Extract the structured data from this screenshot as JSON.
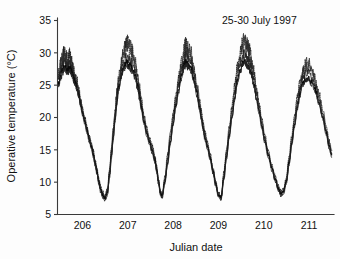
{
  "chart_data": {
    "type": "line",
    "title": "",
    "annotation": "25-30 July 1997",
    "xlabel": "Julian date",
    "ylabel": "Operative temperature (°C)",
    "xlim": [
      205.45,
      211.55
    ],
    "ylim": [
      5,
      35
    ],
    "xticks": [
      206,
      207,
      208,
      209,
      210,
      211
    ],
    "xtick_labels": [
      "206",
      "207",
      "208",
      "209",
      "210",
      "211"
    ],
    "yticks": [
      5,
      10,
      15,
      20,
      25,
      30,
      35
    ],
    "ytick_labels": [
      "5",
      "10",
      "15",
      "20",
      "25",
      "30",
      "35"
    ],
    "grid": false,
    "legend": false,
    "series": [
      {
        "name": "upper-envelope-dotted",
        "style": "dotted",
        "x": [
          205.47,
          205.52,
          205.56,
          205.6,
          205.64,
          205.68,
          205.72,
          205.76,
          205.8,
          205.84,
          205.88,
          205.92,
          205.96,
          206.0,
          206.05,
          206.1,
          206.15,
          206.2,
          206.24,
          206.28,
          206.32,
          206.36,
          206.4,
          206.45,
          206.5,
          206.55,
          206.6,
          206.64,
          206.68,
          206.72,
          206.76,
          206.8,
          206.86,
          206.92,
          206.98,
          207.04,
          207.1,
          207.16,
          207.22,
          207.26,
          207.3,
          207.36,
          207.42,
          207.48,
          207.54,
          207.6,
          207.64,
          207.68,
          207.72,
          207.76,
          207.82,
          207.88,
          207.94,
          208.0,
          208.06,
          208.12,
          208.18,
          208.24,
          208.28,
          208.33,
          208.4,
          208.46,
          208.52,
          208.58,
          208.62,
          208.66,
          208.7,
          208.76,
          208.82,
          208.88,
          208.94,
          209.0,
          209.06,
          209.12,
          209.18,
          209.24,
          209.3,
          209.36,
          209.42,
          209.48,
          209.54,
          209.6,
          209.64,
          209.68,
          209.72,
          209.78,
          209.84,
          209.9,
          209.96,
          210.02,
          210.1,
          210.18,
          210.26,
          210.32,
          210.38,
          210.44,
          210.5,
          210.56,
          210.62,
          210.68,
          210.74,
          210.8,
          210.86,
          210.92,
          210.98,
          211.06,
          211.14,
          211.22,
          211.3,
          211.38,
          211.44,
          211.5
        ],
        "y": [
          26.6,
          28.3,
          29.2,
          30.1,
          29.4,
          28.9,
          29.6,
          28.6,
          27.3,
          26.3,
          25.6,
          24.2,
          22.8,
          21.4,
          20.1,
          18.6,
          17.2,
          16.0,
          14.8,
          13.4,
          12.1,
          10.6,
          9.3,
          8.4,
          7.9,
          9.0,
          12.2,
          15.4,
          18.3,
          21.2,
          24.0,
          26.4,
          28.8,
          30.4,
          31.6,
          31.0,
          30.5,
          28.7,
          26.4,
          24.6,
          22.8,
          20.3,
          18.4,
          16.9,
          15.6,
          14.0,
          12.3,
          10.3,
          8.6,
          8.2,
          10.9,
          14.3,
          17.6,
          20.6,
          23.4,
          26.0,
          28.3,
          30.2,
          31.4,
          30.6,
          29.8,
          27.6,
          25.3,
          22.9,
          21.1,
          19.3,
          17.8,
          16.1,
          14.3,
          12.2,
          10.1,
          8.3,
          7.9,
          11.5,
          15.2,
          18.6,
          21.8,
          25.0,
          27.8,
          30.0,
          31.6,
          32.0,
          31.1,
          30.4,
          29.3,
          27.1,
          24.5,
          22.0,
          19.6,
          17.4,
          14.9,
          12.6,
          10.8,
          9.4,
          8.6,
          9.1,
          10.8,
          14.0,
          17.2,
          20.3,
          23.0,
          25.4,
          27.2,
          28.1,
          28.5,
          27.4,
          25.8,
          23.6,
          21.2,
          18.6,
          16.4,
          14.9
        ]
      },
      {
        "name": "mid-trace",
        "style": "solid-thin",
        "x": [
          205.47,
          205.52,
          205.56,
          205.6,
          205.64,
          205.68,
          205.72,
          205.76,
          205.8,
          205.84,
          205.88,
          205.92,
          205.96,
          206.0,
          206.05,
          206.1,
          206.15,
          206.2,
          206.24,
          206.28,
          206.32,
          206.36,
          206.4,
          206.45,
          206.5,
          206.55,
          206.6,
          206.64,
          206.68,
          206.72,
          206.76,
          206.8,
          206.86,
          206.92,
          206.98,
          207.04,
          207.1,
          207.16,
          207.22,
          207.26,
          207.3,
          207.36,
          207.42,
          207.48,
          207.54,
          207.6,
          207.64,
          207.68,
          207.72,
          207.76,
          207.82,
          207.88,
          207.94,
          208.0,
          208.06,
          208.12,
          208.18,
          208.24,
          208.28,
          208.33,
          208.4,
          208.46,
          208.52,
          208.58,
          208.62,
          208.66,
          208.7,
          208.76,
          208.82,
          208.88,
          208.94,
          209.0,
          209.06,
          209.12,
          209.18,
          209.24,
          209.3,
          209.36,
          209.42,
          209.48,
          209.54,
          209.6,
          209.64,
          209.68,
          209.72,
          209.78,
          209.84,
          209.9,
          209.96,
          210.02,
          210.1,
          210.18,
          210.26,
          210.32,
          210.38,
          210.44,
          210.5,
          210.56,
          210.62,
          210.68,
          210.74,
          210.8,
          210.86,
          210.92,
          210.98,
          211.06,
          211.14,
          211.22,
          211.3,
          211.38,
          211.44,
          211.5
        ],
        "y": [
          25.8,
          27.2,
          28.0,
          28.6,
          28.2,
          27.9,
          28.3,
          27.6,
          26.6,
          25.8,
          25.0,
          23.8,
          22.4,
          21.0,
          19.7,
          18.3,
          16.9,
          15.7,
          14.5,
          13.1,
          11.8,
          10.3,
          9.0,
          8.1,
          7.6,
          8.6,
          11.6,
          14.7,
          17.6,
          20.4,
          23.1,
          25.5,
          27.6,
          28.9,
          29.4,
          29.0,
          28.4,
          27.1,
          25.3,
          23.7,
          22.0,
          19.7,
          17.9,
          16.4,
          15.1,
          13.6,
          12.0,
          10.1,
          8.4,
          8.0,
          10.4,
          13.6,
          16.8,
          19.8,
          22.5,
          25.0,
          27.2,
          28.9,
          29.6,
          29.1,
          28.4,
          26.5,
          24.4,
          22.2,
          20.5,
          18.8,
          17.3,
          15.7,
          13.9,
          11.9,
          9.9,
          8.1,
          7.7,
          11.0,
          14.5,
          17.8,
          20.9,
          23.9,
          26.6,
          28.5,
          29.7,
          29.9,
          29.3,
          28.7,
          27.8,
          25.9,
          23.6,
          21.3,
          19.0,
          16.9,
          14.5,
          12.3,
          10.5,
          9.1,
          8.3,
          8.8,
          10.4,
          13.4,
          16.5,
          19.5,
          22.1,
          24.4,
          26.1,
          26.8,
          27.0,
          26.2,
          24.8,
          22.8,
          20.5,
          18.0,
          15.9,
          14.4
        ]
      },
      {
        "name": "lower-trace",
        "style": "solid",
        "x": [
          205.47,
          205.52,
          205.56,
          205.6,
          205.64,
          205.68,
          205.72,
          205.76,
          205.8,
          205.84,
          205.88,
          205.92,
          205.96,
          206.0,
          206.05,
          206.1,
          206.15,
          206.2,
          206.24,
          206.28,
          206.32,
          206.36,
          206.4,
          206.45,
          206.5,
          206.55,
          206.6,
          206.64,
          206.68,
          206.72,
          206.76,
          206.8,
          206.86,
          206.92,
          206.98,
          207.04,
          207.1,
          207.16,
          207.22,
          207.26,
          207.3,
          207.36,
          207.42,
          207.48,
          207.54,
          207.6,
          207.64,
          207.68,
          207.72,
          207.76,
          207.82,
          207.88,
          207.94,
          208.0,
          208.06,
          208.12,
          208.18,
          208.24,
          208.28,
          208.33,
          208.4,
          208.46,
          208.52,
          208.58,
          208.62,
          208.66,
          208.7,
          208.76,
          208.82,
          208.88,
          208.94,
          209.0,
          209.06,
          209.12,
          209.18,
          209.24,
          209.3,
          209.36,
          209.42,
          209.48,
          209.54,
          209.6,
          209.64,
          209.68,
          209.72,
          209.78,
          209.84,
          209.9,
          209.96,
          210.02,
          210.1,
          210.18,
          210.26,
          210.32,
          210.38,
          210.44,
          210.5,
          210.56,
          210.62,
          210.68,
          210.74,
          210.8,
          210.86,
          210.92,
          210.98,
          211.06,
          211.14,
          211.22,
          211.3,
          211.38,
          211.44,
          211.5
        ],
        "y": [
          25.2,
          26.4,
          27.2,
          27.8,
          27.5,
          27.2,
          27.6,
          27.0,
          26.1,
          25.4,
          24.6,
          23.4,
          22.0,
          20.7,
          19.4,
          18.0,
          16.6,
          15.4,
          14.2,
          12.9,
          11.6,
          10.1,
          8.8,
          7.9,
          7.5,
          8.3,
          11.1,
          14.1,
          16.9,
          19.7,
          22.4,
          24.7,
          26.7,
          27.9,
          28.3,
          28.0,
          27.5,
          26.4,
          24.8,
          23.2,
          21.5,
          19.3,
          17.5,
          16.1,
          14.8,
          13.3,
          11.8,
          10.0,
          8.3,
          7.9,
          10.1,
          13.1,
          16.2,
          19.1,
          21.8,
          24.2,
          26.3,
          27.9,
          28.5,
          28.1,
          27.5,
          25.8,
          23.8,
          21.7,
          20.0,
          18.4,
          16.9,
          15.4,
          13.6,
          11.7,
          9.7,
          8.0,
          7.6,
          10.6,
          14.0,
          17.2,
          20.2,
          23.1,
          25.7,
          27.5,
          28.6,
          28.8,
          28.3,
          27.8,
          27.0,
          25.2,
          23.0,
          20.8,
          18.6,
          16.5,
          14.2,
          12.1,
          10.3,
          9.0,
          8.2,
          8.6,
          10.1,
          13.0,
          16.0,
          18.9,
          21.5,
          23.7,
          25.3,
          26.0,
          26.2,
          25.5,
          24.2,
          22.3,
          20.1,
          17.7,
          15.6,
          14.2
        ]
      }
    ]
  },
  "axes": {
    "ylabel": "Operative temperature (°C)",
    "xlabel": "Julian date"
  },
  "annotation": {
    "text": "25-30 July 1997"
  },
  "colors": {
    "axis": "#3a3a3a",
    "trace": "#0a0a0a",
    "background": "#ffffff"
  }
}
